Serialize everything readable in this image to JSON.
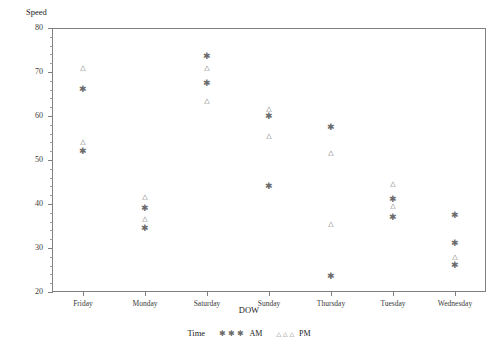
{
  "chart_data": {
    "type": "scatter",
    "title": "",
    "xlabel": "DOW",
    "ylabel": "Speed",
    "ylim": [
      20,
      80
    ],
    "yticks": [
      20,
      30,
      40,
      50,
      60,
      70,
      80
    ],
    "yminor_step": 2,
    "grid": false,
    "legend_position": "bottom",
    "legend_title": "Time",
    "categories": [
      "Friday",
      "Monday",
      "Saturday",
      "Sunday",
      "Thursday",
      "Tuesday",
      "Wednesday"
    ],
    "series": [
      {
        "name": "AM",
        "marker": "asterisk",
        "glyph": "✱",
        "points": [
          {
            "x": "Friday",
            "y": 66.5
          },
          {
            "x": "Friday",
            "y": 52.5
          },
          {
            "x": "Monday",
            "y": 39.5
          },
          {
            "x": "Monday",
            "y": 35.0
          },
          {
            "x": "Saturday",
            "y": 74.0
          },
          {
            "x": "Saturday",
            "y": 68.0
          },
          {
            "x": "Sunday",
            "y": 60.5
          },
          {
            "x": "Sunday",
            "y": 44.5
          },
          {
            "x": "Thursday",
            "y": 58.0
          },
          {
            "x": "Thursday",
            "y": 24.0
          },
          {
            "x": "Tuesday",
            "y": 41.5
          },
          {
            "x": "Tuesday",
            "y": 37.5
          },
          {
            "x": "Wednesday",
            "y": 38.0
          },
          {
            "x": "Wednesday",
            "y": 31.5
          },
          {
            "x": "Wednesday",
            "y": 26.5
          }
        ]
      },
      {
        "name": "PM",
        "marker": "triangle",
        "glyph": "△",
        "points": [
          {
            "x": "Friday",
            "y": 71.0
          },
          {
            "x": "Friday",
            "y": 54.0
          },
          {
            "x": "Monday",
            "y": 41.5
          },
          {
            "x": "Monday",
            "y": 36.5
          },
          {
            "x": "Saturday",
            "y": 71.0
          },
          {
            "x": "Saturday",
            "y": 63.5
          },
          {
            "x": "Sunday",
            "y": 61.5
          },
          {
            "x": "Sunday",
            "y": 55.5
          },
          {
            "x": "Thursday",
            "y": 51.5
          },
          {
            "x": "Thursday",
            "y": 35.5
          },
          {
            "x": "Tuesday",
            "y": 44.5
          },
          {
            "x": "Tuesday",
            "y": 39.5
          },
          {
            "x": "Wednesday",
            "y": 28.0
          }
        ]
      }
    ]
  },
  "axes": {
    "y_title": "Speed",
    "x_title": "DOW"
  },
  "legend": {
    "title": "Time",
    "entries": [
      {
        "label": "AM",
        "symbols": "✱ ✱ ✱"
      },
      {
        "label": "PM",
        "symbols": "△ △ △"
      }
    ]
  },
  "colors": {
    "axis": "#808080",
    "marker": "#6b6b6b",
    "text": "#1a1a1a",
    "background": "#ffffff"
  }
}
